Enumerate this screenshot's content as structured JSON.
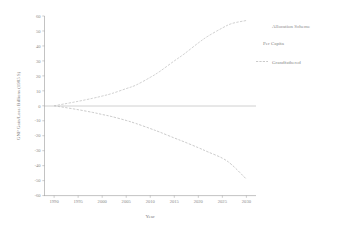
{
  "chart_data": {
    "type": "line",
    "title": "",
    "xlabel": "Year",
    "ylabel": "GNP Gain/Loss: Billions (1985 $)",
    "xlim": [
      1988,
      2032
    ],
    "ylim": [
      -60,
      60
    ],
    "grid": false,
    "legend_position": "right",
    "legend_title": "Allocation Scheme",
    "x_ticks": [
      "1990",
      "1995",
      "2000",
      "2005",
      "2010",
      "2015",
      "2020",
      "2025",
      "2030"
    ],
    "x_tick_values": [
      1990,
      1995,
      2000,
      2005,
      2010,
      2015,
      2020,
      2025,
      2030
    ],
    "y_ticks": [
      "60",
      "50",
      "40",
      "30",
      "20",
      "10",
      "0",
      "-10",
      "-20",
      "-30",
      "-40",
      "-50",
      "-60"
    ],
    "y_tick_values": [
      60,
      50,
      40,
      30,
      20,
      10,
      0,
      -10,
      -20,
      -30,
      -40,
      -50,
      -60
    ],
    "x": [
      1990,
      1992,
      1995,
      1998,
      2000,
      2002,
      2005,
      2007,
      2010,
      2012,
      2015,
      2017,
      2020,
      2022,
      2025,
      2027,
      2030
    ],
    "series": [
      {
        "name": "Per Capita",
        "style": "solid-faint",
        "values": [
          0,
          1.2,
          3.0,
          5.0,
          6.5,
          8.2,
          11.5,
          13.8,
          19.0,
          23.0,
          30.0,
          34.5,
          42.0,
          46.5,
          52.0,
          55.0,
          57.0
        ]
      },
      {
        "name": "Grandfathered",
        "style": "dashed",
        "values": [
          0,
          -1.0,
          -2.6,
          -4.4,
          -5.8,
          -7.2,
          -9.8,
          -11.8,
          -15.2,
          -17.6,
          -21.5,
          -24.0,
          -28.0,
          -30.8,
          -35.0,
          -39.5,
          -49.0
        ]
      }
    ],
    "reference_lines": [
      {
        "name": "zero-line",
        "axis": "y",
        "value": 0
      }
    ]
  },
  "legend": {
    "title": "Allocation Scheme",
    "entries": [
      {
        "label": "Per Capita",
        "marker": "none"
      },
      {
        "label": "Grandfathered",
        "marker": "dashed-line"
      }
    ]
  },
  "axes": {
    "x_title": "Year",
    "y_title": "GNP Gain/Loss: Billions (1985 $)"
  }
}
